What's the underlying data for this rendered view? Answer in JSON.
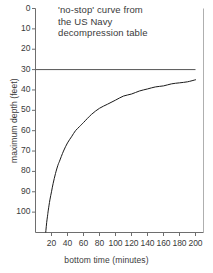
{
  "chart_data": {
    "type": "line",
    "title": "'no-stop' curve from the US Navy decompression table",
    "title_lines": [
      "'no-stop' curve from",
      "the US Navy",
      "decompression table"
    ],
    "xlabel": "bottom time (minutes)",
    "ylabel": "maximum depth (feet)",
    "xlim": [
      0,
      210
    ],
    "ylim": [
      110,
      0
    ],
    "y_inverted": true,
    "grid": false,
    "legend": null,
    "xticks": [
      20,
      40,
      60,
      80,
      100,
      120,
      140,
      160,
      180,
      200
    ],
    "xtick_labels": [
      "20",
      "40",
      "60",
      "80",
      "100",
      "120",
      "140",
      "160",
      "180",
      "200"
    ],
    "yticks": [
      0,
      10,
      20,
      30,
      40,
      50,
      60,
      70,
      80,
      90,
      100
    ],
    "ytick_labels": [
      "0",
      "10",
      "20",
      "30",
      "40",
      "50",
      "60",
      "70",
      "80",
      "90",
      "100"
    ],
    "series": [
      {
        "name": "no-stop curve",
        "color": "#1a1a1a",
        "x": [
          12,
          13,
          14,
          15,
          16,
          18,
          20,
          22,
          25,
          28,
          30,
          35,
          40,
          45,
          50,
          55,
          60,
          70,
          80,
          90,
          100,
          110,
          120,
          130,
          140,
          150,
          160,
          170,
          180,
          190,
          200
        ],
        "y": [
          113,
          109,
          105,
          102,
          99,
          94,
          90,
          86,
          81,
          77,
          75,
          70,
          66,
          63,
          60,
          58,
          56,
          52,
          49,
          47,
          45,
          43,
          42,
          40.5,
          39.5,
          38.5,
          38,
          37,
          36.5,
          36,
          35
        ]
      }
    ],
    "annotations": [
      {
        "name": "asymptote-line",
        "type": "hline",
        "y": 30,
        "x_start": 0,
        "x_end": 200,
        "color": "#555555",
        "label": "30"
      }
    ]
  }
}
